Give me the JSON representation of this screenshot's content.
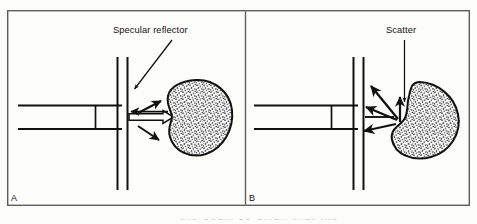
{
  "figure": {
    "name": "specular-reflection-vs-scatter",
    "background_color": "#fdfdfc",
    "ink_color": "#111111",
    "frame": {
      "border_color": "#5a5a5a",
      "border_width": 1.4,
      "x": 7,
      "y": 10,
      "width": 463,
      "height": 196,
      "divider_x": 245
    },
    "bottom_caption_bleed": "the beam so small that the"
  },
  "panels": [
    {
      "id": "A",
      "letter": "A",
      "letter_x": 11,
      "letter_y": 193,
      "annotation": {
        "text": "Specular reflector",
        "x": 113,
        "y": 25,
        "leader": {
          "type": "diagonal-arrow",
          "from": [
            172,
            40
          ],
          "to": [
            133,
            90
          ],
          "head": "down-left"
        }
      },
      "transducer": {
        "top_line_y": 105,
        "bottom_line_y": 129,
        "x_start": 18,
        "x_end": 122,
        "element_x": 95,
        "element_top": 105,
        "element_bottom": 129
      },
      "interface_lines": [
        {
          "x": 117,
          "y_top": 57,
          "y_bottom": 190
        },
        {
          "x": 127,
          "y_top": 57,
          "y_bottom": 190
        }
      ],
      "beam": {
        "type": "hollow-outlined-arrow-right",
        "x_start": 129,
        "x_end": 173,
        "center_y": 117,
        "half_height": 3.2
      },
      "arrows": [
        {
          "name": "reflected-beam-arrow",
          "from": [
            168,
            112
          ],
          "to": [
            128,
            112
          ],
          "style": "solid-black",
          "direction": "left"
        },
        {
          "name": "specular-up-arrow",
          "from": [
            137,
            112
          ],
          "to": [
            160,
            100
          ],
          "style": "solid-black",
          "direction": "up-right"
        },
        {
          "name": "specular-down-arrow",
          "from": [
            137,
            126
          ],
          "to": [
            158,
            140
          ],
          "style": "solid-black",
          "direction": "down-right"
        }
      ],
      "target": {
        "name": "specular-reflector-body",
        "shape": "kidney-bean-stippled",
        "notch_side": "left",
        "bbox": [
          166,
          80,
          68,
          76
        ],
        "fill": "stipple",
        "outline_color": "#111111"
      }
    },
    {
      "id": "B",
      "letter": "B",
      "letter_x": 249,
      "letter_y": 193,
      "annotation": {
        "text": "Scatter",
        "x": 386,
        "y": 25,
        "leader": {
          "type": "vertical-arrow",
          "from": [
            404,
            40
          ],
          "to": [
            404,
            104
          ],
          "head": "down"
        }
      },
      "transducer": {
        "top_line_y": 105,
        "bottom_line_y": 129,
        "x_start": 254,
        "x_end": 358,
        "element_x": 331,
        "element_top": 105,
        "element_bottom": 129
      },
      "interface_lines": [
        {
          "x": 353,
          "y_top": 57,
          "y_bottom": 190
        },
        {
          "x": 363,
          "y_top": 57,
          "y_bottom": 190
        }
      ],
      "beam": {
        "type": "single-line-right",
        "x_start": 365,
        "x_end": 396,
        "center_y": 117
      },
      "arrows": [
        {
          "name": "scatter-arrow-up-left",
          "from": [
            398,
            118
          ],
          "to": [
            370,
            84
          ],
          "style": "solid-black",
          "direction": "up-left"
        },
        {
          "name": "scatter-arrow-up",
          "from": [
            400,
            122
          ],
          "to": [
            400,
            96
          ],
          "style": "solid-black",
          "direction": "up"
        },
        {
          "name": "scatter-arrow-left-upper",
          "from": [
            396,
            120
          ],
          "to": [
            364,
            106
          ],
          "style": "solid-black",
          "direction": "left-up"
        },
        {
          "name": "scatter-arrow-left-lower",
          "from": [
            396,
            124
          ],
          "to": [
            362,
            131
          ],
          "style": "solid-black",
          "direction": "left-down"
        }
      ],
      "target": {
        "name": "scatterer-body",
        "shape": "kidney-bean-stippled-tilted",
        "notch_side": "upper-left",
        "bbox": [
          392,
          78,
          72,
          82
        ],
        "fill": "stipple",
        "outline_color": "#111111"
      }
    }
  ]
}
